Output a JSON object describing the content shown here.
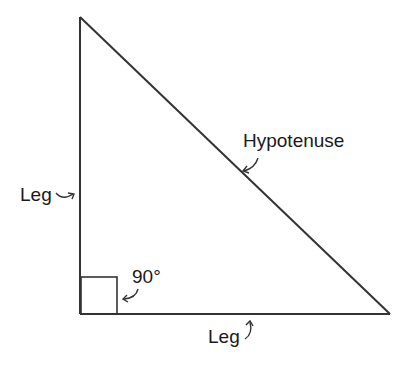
{
  "diagram": {
    "type": "right-triangle",
    "labels": {
      "hypotenuse": "Hypotenuse",
      "vertical_leg": "Leg",
      "horizontal_leg": "Leg",
      "right_angle": "90°"
    },
    "colors": {
      "stroke": "#333333",
      "text": "#1a1a1a",
      "background": "#ffffff"
    }
  }
}
